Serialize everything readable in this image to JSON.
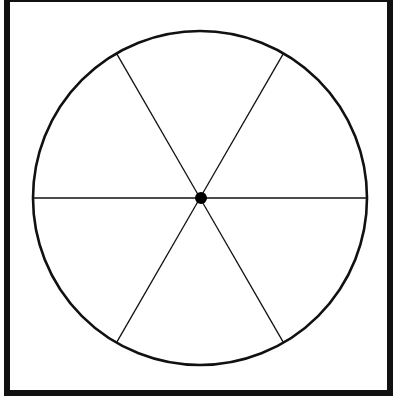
{
  "figure": {
    "type": "spinner",
    "sectors": 6,
    "center": {
      "x": 200,
      "y": 198
    },
    "radius": 167,
    "spoke_angles_deg": [
      0,
      60,
      120,
      180,
      240,
      300
    ],
    "colors": {
      "background": "#ffffff",
      "stroke": "#111111",
      "hub": "#000000"
    }
  }
}
